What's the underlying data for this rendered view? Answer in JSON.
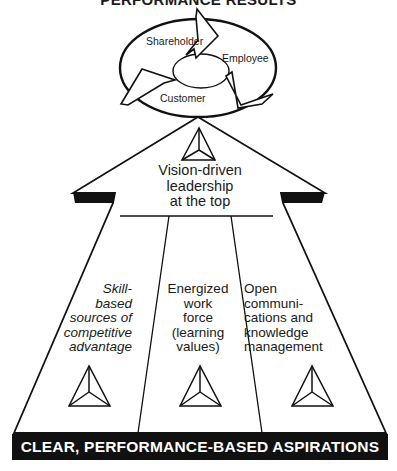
{
  "title": "PERFORMANCE RESULTS",
  "cycle": {
    "labels": [
      "Shareholder",
      "Employee",
      "Customer"
    ]
  },
  "top": {
    "lines": [
      "Vision-driven",
      "leadership",
      "at the top"
    ]
  },
  "columns": [
    {
      "lines": [
        "Skill-",
        "based",
        "sources of",
        "competitive",
        "advantage"
      ],
      "style": "italic"
    },
    {
      "lines": [
        "Energized",
        "work",
        "force",
        "(learning",
        "values)"
      ],
      "style": "normal"
    },
    {
      "lines": [
        "Open",
        "communi-",
        "cations and",
        "knowledge",
        "management"
      ],
      "style": "normal"
    }
  ],
  "base_bar": "CLEAR, PERFORMANCE-BASED ASPIRATIONS",
  "icons": [
    "pyramid-icon-top",
    "pyramid-icon-left",
    "pyramid-icon-center",
    "pyramid-icon-right"
  ],
  "colors": {
    "ink": "#111111",
    "background": "#ffffff"
  }
}
